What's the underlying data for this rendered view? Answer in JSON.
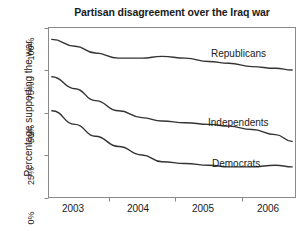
{
  "chart_data": {
    "type": "line",
    "title": "Partisan disagreement over the Iraq war",
    "xlabel": "",
    "ylabel": "Percentage supporting the war",
    "grid": false,
    "legend_position": "inline-right",
    "xlim": [
      2002.6,
      2006.3
    ],
    "ylim": [
      0,
      100
    ],
    "yticks": [
      0,
      25,
      50,
      75,
      100
    ],
    "ytick_labels": [
      "0%",
      "25%",
      "50%",
      "75%",
      "100%"
    ],
    "xticks": [
      2003.5,
      2004.5,
      2005.5
    ],
    "xtick_labels": [
      "2003",
      "2004",
      "2005",
      "2006"
    ],
    "x": [
      2002.65,
      2003.0,
      2003.3,
      2003.65,
      2004.0,
      2004.3,
      2004.65,
      2005.0,
      2005.3,
      2005.65,
      2006.0,
      2006.25
    ],
    "series": [
      {
        "name": "Republicans",
        "label": "Republicans",
        "values": [
          93,
          89,
          85,
          82,
          82,
          83,
          82,
          80,
          79,
          77,
          76,
          75
        ]
      },
      {
        "name": "Independents",
        "label": "Independents",
        "values": [
          71,
          64,
          57,
          51,
          47,
          45,
          44,
          43,
          42,
          40,
          37,
          33
        ]
      },
      {
        "name": "Democrats",
        "label": "Democrats",
        "values": [
          51,
          43,
          36,
          30,
          25,
          21,
          20,
          19,
          18,
          18,
          19,
          18
        ]
      }
    ]
  },
  "colors": {
    "line": "#333333",
    "axis": "#808080",
    "text": "#1a1a1a",
    "background": "#ffffff"
  }
}
